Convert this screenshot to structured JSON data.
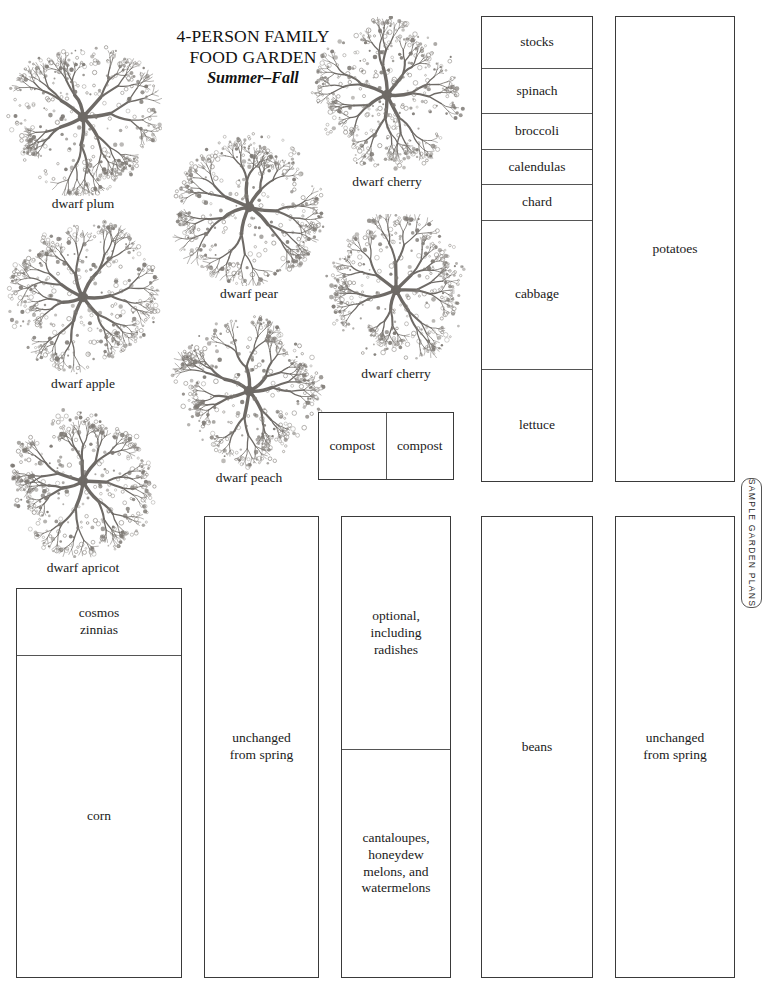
{
  "title": {
    "line1": "4-PERSON FAMILY",
    "line2": "FOOD GARDEN",
    "season": "Summer–Fall"
  },
  "side_tab": {
    "label": "SAMPLE GARDEN PLANS"
  },
  "trees": [
    {
      "label": "dwarf plum",
      "x": 4,
      "y": 38,
      "size": 158,
      "seed": 11
    },
    {
      "label": "dwarf apple",
      "x": 4,
      "y": 218,
      "size": 158,
      "seed": 23
    },
    {
      "label": "dwarf apricot",
      "x": 4,
      "y": 402,
      "size": 158,
      "seed": 37
    },
    {
      "label": "dwarf pear",
      "x": 170,
      "y": 128,
      "size": 158,
      "seed": 51
    },
    {
      "label": "dwarf peach",
      "x": 170,
      "y": 312,
      "size": 158,
      "seed": 67
    },
    {
      "label": "dwarf cherry",
      "x": 308,
      "y": 16,
      "size": 158,
      "seed": 79
    },
    {
      "label": "dwarf cherry",
      "x": 320,
      "y": 214,
      "size": 152,
      "seed": 91
    }
  ],
  "beds": [
    {
      "name": "north-vegetable-bed",
      "x": 481,
      "y": 16,
      "w": 112,
      "h": 466,
      "cells": [
        {
          "label": "stocks",
          "flex": 52
        },
        {
          "label": "spinach",
          "flex": 45
        },
        {
          "label": "broccoli",
          "flex": 35
        },
        {
          "label": "calendulas",
          "flex": 35
        },
        {
          "label": "chard",
          "flex": 35
        },
        {
          "label": "cabbage",
          "flex": 151
        },
        {
          "label": "lettuce",
          "flex": 113
        }
      ]
    },
    {
      "name": "potatoes-bed",
      "x": 615,
      "y": 16,
      "w": 120,
      "h": 466,
      "cells": [
        {
          "label": "potatoes",
          "flex": 1
        }
      ]
    },
    {
      "name": "compost-bins",
      "x": 318,
      "y": 412,
      "w": 136,
      "h": 68,
      "orientation": "horizontal",
      "cells": [
        {
          "label": "compost",
          "flex": 1
        },
        {
          "label": "compost",
          "flex": 1
        }
      ]
    },
    {
      "name": "flowers-and-corn-bed",
      "x": 16,
      "y": 588,
      "w": 166,
      "h": 390,
      "cells": [
        {
          "label": "cosmos\nzinnias",
          "flex": 66
        },
        {
          "label": "corn",
          "flex": 324
        }
      ]
    },
    {
      "name": "unchanged-spring-bed-left",
      "x": 204,
      "y": 516,
      "w": 115,
      "h": 462,
      "cells": [
        {
          "label": "unchanged\nfrom spring",
          "flex": 1
        }
      ]
    },
    {
      "name": "radishes-and-melons-bed",
      "x": 341,
      "y": 516,
      "w": 110,
      "h": 462,
      "cells": [
        {
          "label": "optional,\nincluding\nradishes",
          "flex": 234
        },
        {
          "label": "cantaloupes,\nhoneydew\nmelons, and\nwatermelons",
          "flex": 228
        }
      ]
    },
    {
      "name": "beans-bed",
      "x": 481,
      "y": 516,
      "w": 112,
      "h": 462,
      "cells": [
        {
          "label": "beans",
          "flex": 1
        }
      ]
    },
    {
      "name": "unchanged-spring-bed-right",
      "x": 615,
      "y": 516,
      "w": 120,
      "h": 462,
      "cells": [
        {
          "label": "unchanged\nfrom spring",
          "flex": 1
        }
      ]
    }
  ]
}
